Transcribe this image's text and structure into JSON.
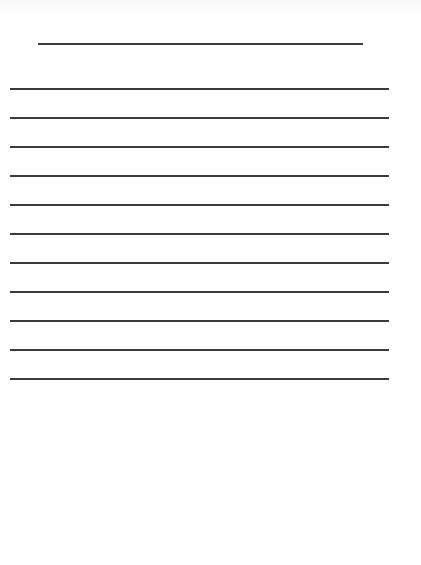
{
  "document": {
    "type": "lined-writing-paper",
    "background_color": "#ffffff",
    "line_color": "#3c3c3c",
    "line_thickness_px": 2,
    "title_line": {
      "x_start": 38,
      "x_end": 363,
      "y": 43
    },
    "ruled_lines": {
      "count": 11,
      "x_start": 10,
      "x_end": 389,
      "y_positions": [
        88,
        117,
        146,
        175,
        204,
        233,
        262,
        291,
        320,
        349,
        378
      ]
    }
  }
}
